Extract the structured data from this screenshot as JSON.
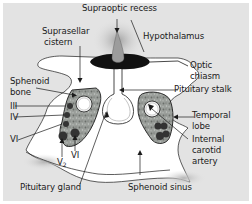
{
  "colors": {
    "background": "#e3e3e3",
    "white_matter": "#ffffff",
    "sinus_fill": "#a8aca8",
    "dark": "#1a1a1a",
    "nerve": "#3b3b3b",
    "glow": "#c9c9c9"
  },
  "labels": {
    "supraoptic_recess": "Supraoptic recess",
    "hypothalamus": "Hypothalamus",
    "suprasellar_cistern_1": "Suprasellar",
    "suprasellar_cistern_2": "cistern",
    "optic_chiasm_1": "Optic",
    "optic_chiasm_2": "chiasm",
    "pituitary_stalk": "Pituitary stalk",
    "sphenoid_bone_1": "Sphenoid",
    "sphenoid_bone_2": "bone",
    "nerve_III": "III",
    "nerve_IV": "IV",
    "nerve_VI_left": "VI",
    "nerve_V2_main": "V",
    "nerve_V2_sub": "2",
    "nerve_VI_bottom": "VI",
    "temporal_lobe_1": "Temporal",
    "temporal_lobe_2": "lobe",
    "internal_carotid_1": "Internal",
    "internal_carotid_2": "carotid",
    "internal_carotid_3": "artery",
    "pituitary_gland": "Pituitary gland",
    "sphenoid_sinus": "Sphenoid sinus"
  }
}
